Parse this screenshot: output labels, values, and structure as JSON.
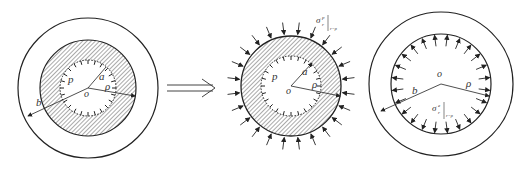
{
  "figure": {
    "panels": [
      {
        "id": "whole",
        "center": [
          88,
          88
        ],
        "radii": {
          "inner": 28,
          "plastic_boundary": 48,
          "outer": 70
        },
        "labels": {
          "pressure": "p",
          "inner_radius": "a",
          "plastic_radius": "ρ",
          "outer_radius": "b",
          "origin": "o"
        }
      },
      {
        "id": "plastic-zone",
        "center": [
          291,
          86
        ],
        "radii": {
          "inner": 30,
          "outer": 50
        },
        "labels": {
          "pressure": "p",
          "inner_radius": "a",
          "plastic_radius": "ρ",
          "origin": "o",
          "stress": "σ",
          "stress_sup": "p",
          "stress_sub": "r",
          "stress_cond": "r=ρ"
        }
      },
      {
        "id": "elastic-zone",
        "center": [
          441,
          84
        ],
        "radii": {
          "inner": 50,
          "outer": 72
        },
        "labels": {
          "outer_radius": "b",
          "plastic_radius": "ρ",
          "origin": "o",
          "stress": "σ",
          "stress_sup": "e",
          "stress_sub": "r",
          "stress_cond": "r=ρ"
        }
      }
    ],
    "arrow": {
      "symbol": "⟹",
      "from": 167,
      "to": 215,
      "y": 88
    },
    "colors": {
      "stroke": "#222222",
      "hatch": "#555555",
      "background": "#ffffff"
    }
  }
}
